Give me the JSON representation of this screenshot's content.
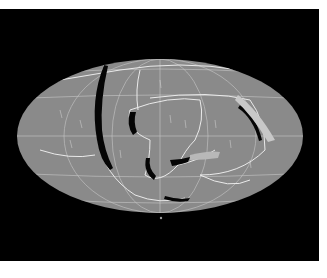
{
  "figure": {
    "colors": {
      "background": "#ffffff",
      "frame": "#000000",
      "globe": "#8a8a8a",
      "lines": "#e0e0e0",
      "trenches": "#050505"
    },
    "caption": ""
  }
}
